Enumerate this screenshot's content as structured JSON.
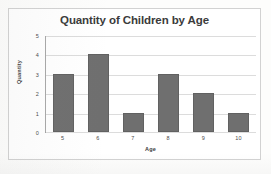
{
  "chart_data": {
    "type": "bar",
    "title": "Quantity of Children by Age",
    "xlabel": "Age",
    "ylabel": "Quantity",
    "categories": [
      "5",
      "6",
      "7",
      "8",
      "9",
      "10"
    ],
    "values": [
      3,
      4,
      1,
      3,
      2,
      1
    ],
    "ylim": [
      0,
      5
    ],
    "yticks": [
      "5",
      "4",
      "3",
      "2",
      "1",
      "0"
    ],
    "grid": true,
    "legend": false,
    "bar_color": "#6f6f6f",
    "gridline_color": "#dcdcdc",
    "axis_color": "#9a9a9a",
    "frame_color": "#d2d2d2",
    "background": "#ffffff"
  },
  "artifacts": {
    "bleed_top": "",
    "bleed_mid": "",
    "bleed_bottom": ""
  }
}
